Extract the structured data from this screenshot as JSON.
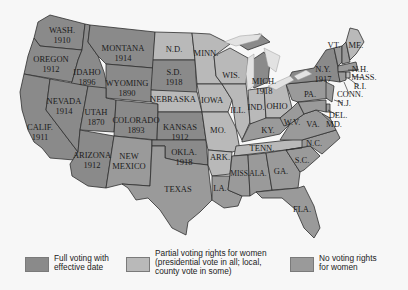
{
  "colors": {
    "full": "#8a8a8a",
    "partial": "#b9b9b9",
    "none": "#9a9a9a",
    "background": "#f7f7f7"
  },
  "states": {
    "wa": {
      "name": "WASH.",
      "year": "1910",
      "status": "full"
    },
    "or": {
      "name": "OREGON",
      "year": "1912",
      "status": "full"
    },
    "ca": {
      "name": "CALIF.",
      "year": "1911",
      "status": "full"
    },
    "id": {
      "name": "IDAHO",
      "year": "1896",
      "status": "full"
    },
    "nv": {
      "name": "NEVADA",
      "year": "1914",
      "status": "full"
    },
    "mt": {
      "name": "MONTANA",
      "year": "1914",
      "status": "full"
    },
    "wy": {
      "name": "WYOMING",
      "year": "1890",
      "status": "full"
    },
    "ut": {
      "name": "UTAH",
      "year": "1870",
      "status": "full"
    },
    "co": {
      "name": "COLORADO",
      "year": "1893",
      "status": "full"
    },
    "az": {
      "name": "ARIZONA",
      "year": "1912",
      "status": "full"
    },
    "nm": {
      "name": "NEW",
      "name2": "MEXICO",
      "status": "none"
    },
    "nd": {
      "name": "N.D.",
      "status": "partial"
    },
    "sd": {
      "name": "S.D.",
      "year": "1918",
      "status": "full"
    },
    "ne": {
      "name": "NEBRASKA",
      "status": "partial"
    },
    "ks": {
      "name": "KANSAS",
      "year": "1912",
      "status": "full"
    },
    "ok": {
      "name": "OKLA.",
      "year": "1918",
      "status": "full"
    },
    "tx": {
      "name": "TEXAS",
      "status": "none"
    },
    "mn": {
      "name": "MINN.",
      "status": "partial"
    },
    "ia": {
      "name": "IOWA",
      "status": "partial"
    },
    "mo": {
      "name": "MO.",
      "status": "partial"
    },
    "ar": {
      "name": "ARK.",
      "status": "partial"
    },
    "la": {
      "name": "LA.",
      "status": "none"
    },
    "wi": {
      "name": "WIS.",
      "status": "partial"
    },
    "il": {
      "name": "ILL.",
      "status": "partial"
    },
    "mi": {
      "name": "MICH.",
      "year": "1918",
      "status": "full"
    },
    "in": {
      "name": "IND.",
      "status": "partial"
    },
    "oh": {
      "name": "OHIO",
      "status": "partial"
    },
    "ky": {
      "name": "KY.",
      "status": "none"
    },
    "tn": {
      "name": "TENN.",
      "status": "partial"
    },
    "ms": {
      "name": "MISS.",
      "status": "none"
    },
    "al": {
      "name": "ALA.",
      "status": "none"
    },
    "ga": {
      "name": "GA.",
      "status": "none"
    },
    "fl": {
      "name": "FLA.",
      "status": "none"
    },
    "sc": {
      "name": "S.C.",
      "status": "none"
    },
    "nc": {
      "name": "N.C.",
      "status": "none"
    },
    "va": {
      "name": "VA.",
      "status": "none"
    },
    "wv": {
      "name": "W.V.",
      "status": "none"
    },
    "pa": {
      "name": "PA.",
      "status": "none"
    },
    "ny": {
      "name": "N.Y.",
      "year": "1917",
      "status": "full"
    },
    "vt": {
      "name": "VT.",
      "status": "none"
    },
    "me": {
      "name": "ME.",
      "status": "partial"
    },
    "nh": {
      "name": "N.H.",
      "status": "none"
    },
    "ma": {
      "name": "MASS.",
      "status": "none"
    },
    "ri": {
      "name": "R.I.",
      "status": "partial"
    },
    "ct": {
      "name": "CONN.",
      "status": "none"
    },
    "nj": {
      "name": "N.J.",
      "status": "none"
    },
    "de": {
      "name": "DEL.",
      "status": "none"
    },
    "md": {
      "name": "MD.",
      "status": "none"
    }
  },
  "legend": {
    "full": {
      "line1": "Full voting with",
      "line2": "effective date"
    },
    "partial": {
      "line1": "Partial voting rights for women",
      "line2": "(presidential vote in all; local,",
      "line3": "county vote in some)"
    },
    "none": {
      "line1": "No voting rights",
      "line2": "for women"
    }
  }
}
